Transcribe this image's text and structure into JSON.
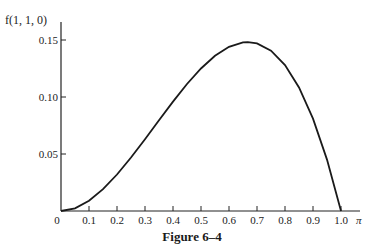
{
  "caption": "Figure 6–4",
  "chart_data": {
    "type": "line",
    "title": "",
    "xlabel": "π",
    "ylabel": "f(1, 1, 0)",
    "xlim": [
      0,
      1.0
    ],
    "ylim": [
      0,
      0.15
    ],
    "grid": false,
    "legend": null,
    "x_ticks": [
      "0",
      "0.1",
      "0.2",
      "0.3",
      "0.4",
      "0.5",
      "0.6",
      "0.7",
      "0.8",
      "0.9",
      "1.0"
    ],
    "y_ticks": [
      "0.05",
      "0.10",
      "0.15"
    ],
    "series": [
      {
        "name": "f(1, 1, 0)",
        "x": [
          0,
          0.05,
          0.1,
          0.15,
          0.2,
          0.25,
          0.3,
          0.35,
          0.4,
          0.45,
          0.5,
          0.55,
          0.6,
          0.65,
          0.667,
          0.7,
          0.75,
          0.8,
          0.85,
          0.9,
          0.95,
          1.0
        ],
        "values": [
          0,
          0.0024,
          0.009,
          0.0191,
          0.032,
          0.0469,
          0.063,
          0.0796,
          0.096,
          0.1114,
          0.125,
          0.1361,
          0.144,
          0.1479,
          0.1481,
          0.147,
          0.1406,
          0.128,
          0.1084,
          0.081,
          0.0451,
          0
        ]
      }
    ],
    "annotations": []
  }
}
